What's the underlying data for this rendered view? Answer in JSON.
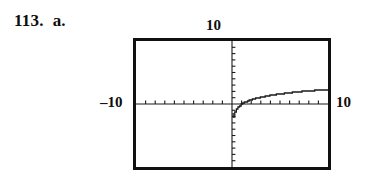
{
  "exercise": {
    "number": "113.",
    "part": "a."
  },
  "graph": {
    "window_labels": {
      "y_max": "10",
      "x_min": "–10",
      "x_max": "10"
    },
    "frame_color": "#111111",
    "curve_color": "#1a1a1a",
    "background_color": "#ffffff"
  },
  "chart_data": {
    "type": "line",
    "title": "",
    "subtitle": "",
    "xlabel": "",
    "ylabel": "",
    "xlim": [
      -10,
      10
    ],
    "ylim": [
      -10,
      10
    ],
    "grid": false,
    "legend": null,
    "axis_ticks": {
      "x_tick_spacing": 1,
      "y_tick_spacing": 1,
      "x_tick_values": [
        -9,
        -8,
        -7,
        -6,
        -5,
        -4,
        -3,
        -2,
        -1,
        1,
        2,
        3,
        4,
        5,
        6,
        7,
        8,
        9
      ],
      "y_tick_values": [
        -9,
        -8,
        -7,
        -6,
        -5,
        -4,
        -3,
        -2,
        -1,
        1,
        2,
        3,
        4,
        5,
        6,
        7,
        8,
        9
      ]
    },
    "annotations": [
      "vertical asymptote at x = 0",
      "curve defined only for x > 0",
      "stair-step pixelated rendering typical of a graphing calculator"
    ],
    "series": [
      {
        "name": "y = ln(x)",
        "x": [
          0.12,
          0.2,
          0.3,
          0.45,
          0.6,
          0.8,
          1.0,
          1.3,
          1.6,
          2.0,
          2.5,
          3.0,
          3.6,
          4.2,
          5.0,
          6.0,
          7.0,
          8.0,
          9.0,
          10.0
        ],
        "y": [
          -2.12,
          -1.61,
          -1.2,
          -0.8,
          -0.51,
          -0.22,
          0.0,
          0.26,
          0.47,
          0.69,
          0.92,
          1.1,
          1.28,
          1.44,
          1.61,
          1.79,
          1.95,
          2.08,
          2.2,
          2.3
        ]
      }
    ]
  }
}
